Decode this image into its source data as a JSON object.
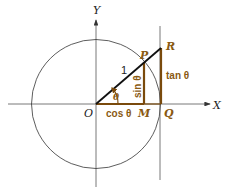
{
  "diagram": {
    "axes": {
      "x_label": "X",
      "y_label": "Y"
    },
    "points": {
      "origin": "O",
      "point_on_circle": "P",
      "tangent_point": "R",
      "foot_perpendicular": "M",
      "x_intercept": "Q"
    },
    "segments": {
      "radius": "1",
      "sin": "sin θ",
      "cos": "cos θ",
      "tan": "tan θ"
    },
    "angle": "θ",
    "colors": {
      "axis": "#444444",
      "circle": "#333333",
      "radius": "#111111",
      "accent": "#7a4a0c",
      "label_accent": "#8a5a12"
    }
  }
}
